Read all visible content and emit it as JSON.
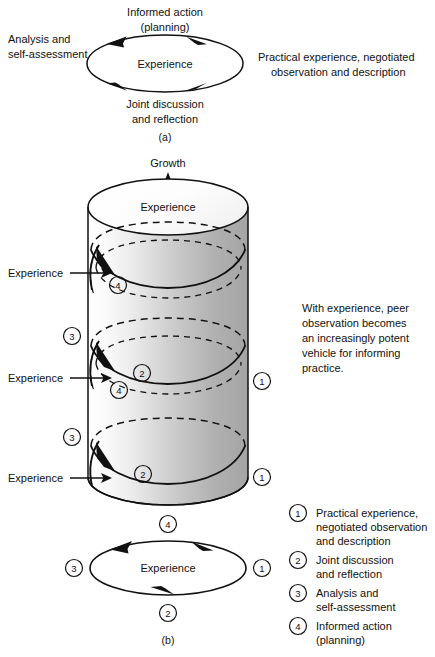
{
  "figure": {
    "title_a": "(a)",
    "title_b": "(b)"
  },
  "diagram_a": {
    "center_label": "Experience",
    "top_label_line1": "Informed action",
    "top_label_line2": "(planning)",
    "bottom_label_line1": "Joint discussion",
    "bottom_label_line2": "and reflection",
    "left_label_line1": "Analysis and",
    "left_label_line2": "self-assessment",
    "right_label_line1": "Practical experience, negotiated",
    "right_label_line2": "observation and description",
    "caption": "(a)"
  },
  "diagram_b": {
    "growth_label": "Growth",
    "top_face_label": "Experience",
    "experience_callouts": [
      "Experience",
      "Experience",
      "Experience"
    ],
    "markers_left": [
      "3",
      "3"
    ],
    "markers_right": [
      "1",
      "1"
    ],
    "markers_surface": [
      "4",
      "4",
      "2",
      "2"
    ],
    "side_note": "With experience, peer observation becomes an increasingly potent vehicle for informing practice.",
    "side_note_lines": [
      "With experience, peer",
      "observation becomes",
      "an increasingly potent",
      "vehicle for informing",
      "practice."
    ],
    "cycle": {
      "center_label": "Experience",
      "top_marker": "4",
      "bottom_marker": "2",
      "left_marker": "3",
      "right_marker": "1"
    },
    "caption": "(b)"
  },
  "legend": {
    "items": [
      {
        "number": "1",
        "lines": [
          "Practical  experience,",
          "negotiated observation",
          "and description"
        ]
      },
      {
        "number": "2",
        "lines": [
          "Joint discussion",
          "and reflection"
        ]
      },
      {
        "number": "3",
        "lines": [
          "Analysis and",
          "self-assessment"
        ]
      },
      {
        "number": "4",
        "lines": [
          "Informed action",
          "(planning)"
        ]
      }
    ]
  },
  "colors": {
    "ink": "#111111",
    "cylinder_light": "#ffffff",
    "cylinder_mid": "#d8d8d8",
    "cylinder_dark": "#a9a9a9",
    "background": "#ffffff"
  }
}
